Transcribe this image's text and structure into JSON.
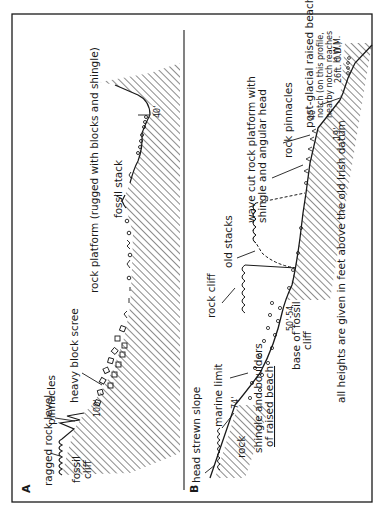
{
  "figure": {
    "orientation": "rotated 90 degrees counter-clockwise",
    "colors": {
      "ink": "#1a1a1a",
      "paper": "#ffffff"
    }
  },
  "panel_a": {
    "label": "A",
    "labels": {
      "ragged_rock_level": "ragged rock level",
      "fossil_cliff_1": "fossil",
      "fossil_cliff_2": "cliff",
      "pinnacles": "pinnacles",
      "heavy_block_scree": "heavy block scree",
      "height_100": "100'",
      "rock_platform": "rock platform (rugged with blocks and shingle)",
      "fossil_stack": "fossil stack",
      "height_40": "40'"
    }
  },
  "panel_b": {
    "label": "B",
    "labels": {
      "head_strewn_slope": "head strewn slope",
      "rock": "rock",
      "marine_limit": "marine limit",
      "height_74": "74'",
      "shingle_1": "shingle and boulders",
      "shingle_2": "of raised beach",
      "rock_cliff": "rock cliff",
      "base_fossil_cliff_1": "base of fossil",
      "base_fossil_cliff_2": "cliff",
      "height_50_54": "50'-54",
      "old_stacks": "old stacks",
      "wave_cut_1": "wave cut rock platform with",
      "wave_cut_2": "shingle and angular head",
      "rock_pinnacles": "rock pinnacles",
      "height_40": "40'",
      "post_glacial_1": "post-glacial raised beach",
      "post_glacial_2": "notch (on this profile,",
      "post_glacial_3": "nearby notch reaches",
      "post_glacial_4": "26ft. O.D.)",
      "height_19": "19'",
      "hwm": "H.W.M.",
      "footnote": "all heights are given in feet above the old Irish datum"
    }
  }
}
